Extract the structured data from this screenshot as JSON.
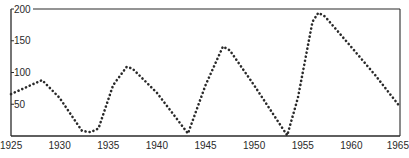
{
  "chart_data": {
    "type": "line",
    "title": "",
    "xlabel": "",
    "ylabel": "",
    "xlim": [
      1925,
      1965
    ],
    "ylim": [
      0,
      200
    ],
    "x_ticks": [
      1925,
      1930,
      1935,
      1940,
      1945,
      1950,
      1955,
      1960,
      1965
    ],
    "y_ticks": [
      50,
      100,
      150,
      200
    ],
    "grid": false,
    "legend": null,
    "line_style": "dotted",
    "line_color": "#2a2a2a",
    "series": [
      {
        "name": "series",
        "points": [
          {
            "x": 1925.0,
            "y": 66
          },
          {
            "x": 1928.2,
            "y": 88
          },
          {
            "x": 1930.0,
            "y": 60
          },
          {
            "x": 1932.3,
            "y": 8
          },
          {
            "x": 1933.2,
            "y": 6
          },
          {
            "x": 1934.0,
            "y": 12
          },
          {
            "x": 1935.5,
            "y": 80
          },
          {
            "x": 1936.9,
            "y": 109
          },
          {
            "x": 1937.5,
            "y": 106
          },
          {
            "x": 1940.0,
            "y": 68
          },
          {
            "x": 1943.2,
            "y": 4
          },
          {
            "x": 1945.0,
            "y": 80
          },
          {
            "x": 1946.8,
            "y": 141
          },
          {
            "x": 1947.5,
            "y": 135
          },
          {
            "x": 1950.0,
            "y": 80
          },
          {
            "x": 1953.4,
            "y": 1
          },
          {
            "x": 1954.5,
            "y": 60
          },
          {
            "x": 1956.0,
            "y": 180
          },
          {
            "x": 1956.6,
            "y": 194
          },
          {
            "x": 1957.3,
            "y": 188
          },
          {
            "x": 1960.0,
            "y": 140
          },
          {
            "x": 1962.5,
            "y": 95
          },
          {
            "x": 1965.0,
            "y": 46
          }
        ]
      }
    ]
  },
  "axis": {
    "y_labels": [
      "200",
      "150",
      "100",
      "50"
    ],
    "x_labels": [
      "1925",
      "1930",
      "1935",
      "1940",
      "1945",
      "1950",
      "1955",
      "1960",
      "1965"
    ]
  }
}
